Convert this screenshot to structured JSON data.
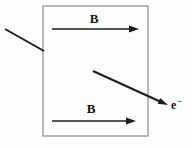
{
  "diagram": {
    "field_region": {
      "top_arrow_label": "B",
      "bottom_arrow_label": "B"
    },
    "electron": {
      "symbol": "e",
      "charge_sign": "−"
    },
    "colors": {
      "background": "#fdfdfd",
      "box_border": "#8c8c8c",
      "line": "#1c1c1c",
      "text": "#111111"
    }
  }
}
